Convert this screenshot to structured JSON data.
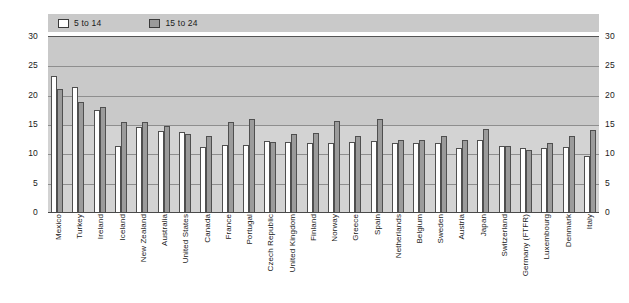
{
  "chart_data": {
    "type": "bar",
    "title": "",
    "xlabel": "",
    "ylabel": "",
    "ylim": [
      0,
      30
    ],
    "yticks": [
      0,
      5,
      10,
      15,
      20,
      25,
      30
    ],
    "grid": true,
    "legend_position": "top-left",
    "dual_y_axis": true,
    "categories": [
      "Mexico",
      "Turkey",
      "Ireland",
      "Iceland",
      "New Zealand",
      "Australia",
      "United States",
      "Canada",
      "France",
      "Portugal",
      "Czech Republic",
      "United Kingdom",
      "Finland",
      "Norway",
      "Greece",
      "Spain",
      "Netherlands",
      "Belgium",
      "Sweden",
      "Austria",
      "Japan",
      "Switzerland",
      "Germany (FTFR)",
      "Luxembourg",
      "Denmark",
      "Italy"
    ],
    "series": [
      {
        "name": "5 to 14",
        "color": "#ffffff",
        "values": [
          23.3,
          21.5,
          17.5,
          11.5,
          14.7,
          13.9,
          13.8,
          11.2,
          11.6,
          11.6,
          12.3,
          12.1,
          12.0,
          11.9,
          12.1,
          12.3,
          12.0,
          11.9,
          11.9,
          11.1,
          12.5,
          11.4,
          11.0,
          11.1,
          11.2,
          9.7
        ]
      },
      {
        "name": "15 to 24",
        "color": "#9b9b9b",
        "values": [
          21.2,
          19.0,
          18.0,
          15.5,
          15.5,
          14.9,
          13.4,
          13.1,
          15.5,
          16.1,
          12.1,
          13.5,
          13.6,
          15.6,
          13.2,
          16.0,
          12.5,
          12.4,
          13.1,
          12.4,
          14.4,
          11.4,
          10.8,
          12.0,
          13.1,
          14.1
        ]
      }
    ]
  },
  "legend": {
    "entries": [
      {
        "label": "5 to 14",
        "swatch": "white-square-icon"
      },
      {
        "label": "15 to 24",
        "swatch": "gray-square-icon"
      }
    ]
  },
  "axes": {
    "left_ticks": [
      "30",
      "25",
      "20",
      "15",
      "10",
      "5",
      "0"
    ],
    "right_ticks": [
      "30",
      "25",
      "20",
      "15",
      "10",
      "5",
      "0"
    ]
  },
  "colors": {
    "plot_background": "#c9c9c9",
    "band_light": "#d3d3d3",
    "gridline": "#8e8e8e",
    "axis_line": "#4a4a4a",
    "series_a": "#ffffff",
    "series_b": "#9b9b9b",
    "text": "#1a1a1a"
  }
}
